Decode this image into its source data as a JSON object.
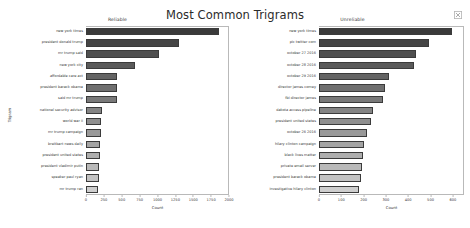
{
  "figure": {
    "title": "Most Common Trigrams",
    "close_icon": "close-icon"
  },
  "chart_data": [
    {
      "type": "bar",
      "orientation": "horizontal",
      "title": "Reliable",
      "xlabel": "Count",
      "ylabel": "Trigram",
      "xlim": [
        0,
        2000
      ],
      "xticks": [
        0,
        250,
        500,
        750,
        1000,
        1250,
        1500,
        1750,
        2000
      ],
      "grid": false,
      "categories": [
        "new york times",
        "president donald trump",
        "mr trump said",
        "new york city",
        "affordable care act",
        "president barack obama",
        "said mr trump",
        "national security advisor",
        "world war ii",
        "mr trump campaign",
        "breitbart news daily",
        "president united states",
        "president vladimir putin",
        "speaker paul ryan",
        "mr trump ran"
      ],
      "values": [
        1880,
        1310,
        1030,
        690,
        440,
        440,
        440,
        230,
        215,
        205,
        200,
        195,
        185,
        180,
        175
      ]
    },
    {
      "type": "bar",
      "orientation": "horizontal",
      "title": "Unreliable",
      "xlabel": "Count",
      "ylabel": "Trigram",
      "xlim": [
        0,
        650
      ],
      "xticks": [
        0,
        100,
        200,
        300,
        400,
        500,
        600
      ],
      "grid": false,
      "categories": [
        "new york times",
        "pic twitter com",
        "october 27 2016",
        "october 28 2016",
        "october 29 2016",
        "director james comey",
        "fbi director james",
        "dakota access pipeline",
        "president united states",
        "october 26 2016",
        "hilary clinton campaign",
        "black lives matter",
        "private email server",
        "president barack obama",
        "investigative hilary clinton"
      ],
      "values": [
        600,
        495,
        440,
        430,
        315,
        300,
        290,
        245,
        235,
        215,
        205,
        200,
        195,
        190,
        180
      ]
    }
  ]
}
